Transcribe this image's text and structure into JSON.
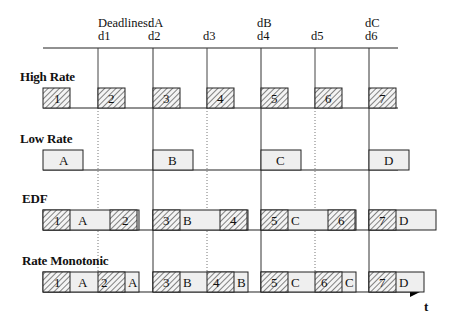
{
  "header": {
    "deadlines_label": "Deadlines:",
    "deadline_marks": [
      {
        "top": "dA",
        "bottom": "d1",
        "x": 98
      },
      {
        "top": "dA",
        "bottom": "d2",
        "x": 153
      },
      {
        "top": "",
        "bottom": "d3",
        "x": 207
      },
      {
        "top": "dB",
        "bottom": "d4",
        "x": 261
      },
      {
        "top": "",
        "bottom": "d5",
        "x": 315
      },
      {
        "top": "dC",
        "bottom": "d6",
        "x": 369
      }
    ],
    "d1": "d1",
    "d2": "d2",
    "d3": "d3",
    "d4": "d4",
    "d5": "d5",
    "d6": "d6",
    "dA": "dA",
    "dB": "dB",
    "dC": "dC"
  },
  "rows": {
    "high_rate": {
      "label": "High Rate",
      "jobs": [
        "1",
        "2",
        "3",
        "4",
        "5",
        "6",
        "7"
      ]
    },
    "low_rate": {
      "label": "Low Rate",
      "jobs": [
        "A",
        "B",
        "C",
        "D"
      ]
    },
    "edf": {
      "label": "EDF",
      "sequence": [
        "1",
        "A",
        "2",
        "3",
        "B",
        "4",
        "5",
        "C",
        "6",
        "7",
        "D"
      ]
    },
    "rate_monotonic": {
      "label": "Rate Monotonic",
      "sequence": [
        "1",
        "A",
        "2",
        "A",
        "3",
        "B",
        "4",
        "B",
        "5",
        "C",
        "6",
        "C",
        "7",
        "D"
      ]
    }
  },
  "axis": {
    "time_label": "t"
  },
  "colors": {
    "line": "#222222",
    "box_fill": "#efefef",
    "hatch": "#333333"
  }
}
